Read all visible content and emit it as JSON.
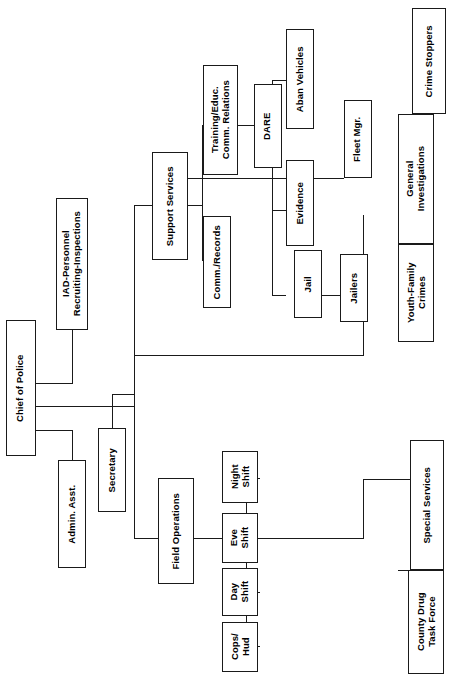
{
  "chart": {
    "orientation": "rotated-90",
    "line_color": "#1a1a1a",
    "box_fill": "#ffffff",
    "background": "#ffffff",
    "nodes": {
      "chief": "Chief of Police",
      "iad": "IAD-Personnel\nRecruiting-Inspections",
      "admin_asst": "Admin. Asst.",
      "secretary": "Secretary",
      "support_services": "Support Services",
      "training_educ": "Training/Educ.\nComm. Relations",
      "dare": "DARE",
      "comm_records": "Comm./Records",
      "aban_vehicles": "Aban Vehicles",
      "fleet_mgr": "Fleet Mgr.",
      "evidence": "Evidence",
      "jail": "Jail",
      "jailers": "Jailers",
      "crime_stoppers": "Crime Stoppers",
      "general_investigations": "General\nInvestigations",
      "youth_family_crimes": "Youth-Family\nCrimes",
      "special_services": "Special Services",
      "county_drug_task_force": "County Drug\nTask Force",
      "field_operations": "Field Operations",
      "night_shift": "Night\nShift",
      "eve_shift": "Eve\nShift",
      "day_shift": "Day\nShift",
      "cops_hud": "Cops/\nHud"
    }
  }
}
